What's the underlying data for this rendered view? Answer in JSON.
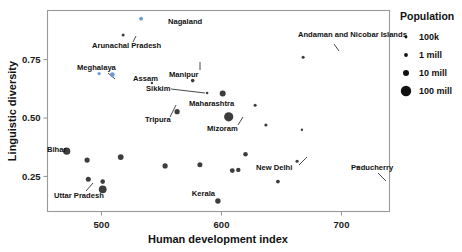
{
  "chart_data": {
    "type": "scatter",
    "title": "",
    "xlabel": "Human development index",
    "ylabel": "Linguistic diversity",
    "xlim": [
      455,
      740
    ],
    "ylim": [
      0.1,
      0.96
    ],
    "xticks": [
      500,
      600,
      700
    ],
    "xtick_labels": [
      "500",
      "600",
      "700"
    ],
    "yticks": [
      0.25,
      0.5,
      0.75
    ],
    "ytick_labels": [
      "0.25",
      "0.50",
      "0.75"
    ],
    "grid": false,
    "size_encoding": "Population",
    "points": [
      {
        "name": "Nagaland",
        "x": 533,
        "y": 0.925,
        "r": 1.9,
        "color": "#6d9bd1",
        "label": "Nagaland",
        "label_x": 168,
        "label_y": 24,
        "anchor": "start",
        "leader": false
      },
      {
        "name": "Arunachal Pradesh",
        "x": 518,
        "y": 0.855,
        "r": 1.5,
        "color": "#3d3d3d",
        "label": "Arunachal Pradesh",
        "label_x": 92,
        "label_y": 48,
        "anchor": "start",
        "leader": true,
        "lx1": 133,
        "ly1": 42,
        "lx2": 136,
        "ly2": 36
      },
      {
        "name": "Meghalaya",
        "x": 498,
        "y": 0.69,
        "r": 1.6,
        "color": "#6d9bd1",
        "label": "Meghalaya",
        "label_x": 77,
        "label_y": 70,
        "anchor": "start",
        "leader": true,
        "lx1": 108,
        "ly1": 73,
        "lx2": 115,
        "ly2": 79
      },
      {
        "name": "Assam",
        "x": 509,
        "y": 0.685,
        "r": 2.4,
        "color": "#6d9bd1",
        "label": "Assam",
        "label_x": 133,
        "label_y": 81,
        "anchor": "start",
        "leader": false
      },
      {
        "name": "Manipur",
        "x": 576,
        "y": 0.66,
        "r": 1.8,
        "color": "#3d3d3d",
        "label": "Manipur",
        "label_x": 169,
        "label_y": 77,
        "anchor": "start",
        "leader": true,
        "lx1": 200,
        "ly1": 70,
        "lx2": 200,
        "ly2": 62
      },
      {
        "name": "Sikkim",
        "x": 588,
        "y": 0.607,
        "r": 1.3,
        "color": "#3d3d3d",
        "label": "Sikkim",
        "label_x": 146,
        "label_y": 91,
        "anchor": "start",
        "leader": true,
        "lx1": 171,
        "ly1": 89,
        "lx2": 205,
        "ly2": 93
      },
      {
        "name": "Maharashtra",
        "x": 601,
        "y": 0.605,
        "r": 3.0,
        "color": "#3d3d3d",
        "label": "Maharashtra",
        "label_x": 189,
        "label_y": 106,
        "anchor": "start",
        "leader": false
      },
      {
        "name": "Tripura",
        "x": 563,
        "y": 0.527,
        "r": 2.6,
        "color": "#3d3d3d",
        "label": "Tripura",
        "label_x": 145,
        "label_y": 122,
        "anchor": "start",
        "leader": true,
        "lx1": 170,
        "ly1": 117,
        "lx2": 176,
        "ly2": 105
      },
      {
        "name": "Maharashtra-big",
        "x": 606,
        "y": 0.505,
        "r": 4.6,
        "color": "#3d3d3d",
        "label": "",
        "label_x": 0,
        "label_y": 0,
        "anchor": "start",
        "leader": false
      },
      {
        "name": "Mizoram",
        "x": 637,
        "y": 0.47,
        "r": 1.6,
        "color": "#3d3d3d",
        "label": "Mizoram",
        "label_x": 207,
        "label_y": 131,
        "anchor": "start",
        "leader": true,
        "lx1": 238,
        "ly1": 125,
        "lx2": 243,
        "ly2": 117
      },
      {
        "name": "Andaman and Nicobar Islands",
        "x": 668,
        "y": 0.76,
        "r": 1.5,
        "color": "#3d3d3d",
        "label": "Andaman and Nicobar Islands",
        "label_x": 298,
        "label_y": 37,
        "anchor": "start",
        "leader": true,
        "lx1": 334,
        "ly1": 44,
        "lx2": 339,
        "ly2": 51
      },
      {
        "name": "Bihar",
        "x": 471,
        "y": 0.358,
        "r": 3.6,
        "color": "#3d3d3d",
        "label": "Bihar",
        "label_x": 47,
        "label_y": 152,
        "anchor": "start",
        "leader": false
      },
      {
        "name": "Uttar Pradesh",
        "x": 501,
        "y": 0.195,
        "r": 3.9,
        "color": "#3d3d3d",
        "label": "Uttar Pradesh",
        "label_x": 54,
        "label_y": 198,
        "anchor": "start",
        "leader": true,
        "lx1": 86,
        "ly1": 191,
        "lx2": 93,
        "ly2": 183
      },
      {
        "name": "Kerala",
        "x": 597,
        "y": 0.145,
        "r": 2.7,
        "color": "#3d3d3d",
        "label": "Kerala",
        "label_x": 215,
        "label_y": 196,
        "anchor": "end",
        "leader": false
      },
      {
        "name": "New Delhi",
        "x": 663,
        "y": 0.315,
        "r": 1.6,
        "color": "#3d3d3d",
        "label": "New Delhi",
        "label_x": 256,
        "label_y": 170,
        "anchor": "start",
        "leader": true,
        "lx1": 299,
        "ly1": 165,
        "lx2": 307,
        "ly2": 157
      },
      {
        "name": "Puducherry",
        "x": 714,
        "y": 0.29,
        "r": 1.3,
        "color": "#3d3d3d",
        "label": "Puducherry",
        "label_x": 351,
        "label_y": 170,
        "anchor": "start",
        "leader": true,
        "lx1": 378,
        "ly1": 173,
        "lx2": 386,
        "ly2": 181
      },
      {
        "name": "p-18",
        "x": 488,
        "y": 0.32,
        "r": 2.6,
        "color": "#3d3d3d",
        "label": "",
        "label_x": 0,
        "label_y": 0,
        "anchor": "start",
        "leader": false
      },
      {
        "name": "p-19",
        "x": 489,
        "y": 0.238,
        "r": 2.5,
        "color": "#3d3d3d",
        "label": "",
        "label_x": 0,
        "label_y": 0,
        "anchor": "start",
        "leader": false
      },
      {
        "name": "p-20",
        "x": 501,
        "y": 0.228,
        "r": 2.3,
        "color": "#3d3d3d",
        "label": "",
        "label_x": 0,
        "label_y": 0,
        "anchor": "start",
        "leader": false
      },
      {
        "name": "p-21",
        "x": 516,
        "y": 0.333,
        "r": 2.9,
        "color": "#3d3d3d",
        "label": "",
        "label_x": 0,
        "label_y": 0,
        "anchor": "start",
        "leader": false
      },
      {
        "name": "p-22",
        "x": 553,
        "y": 0.295,
        "r": 2.6,
        "color": "#3d3d3d",
        "label": "",
        "label_x": 0,
        "label_y": 0,
        "anchor": "start",
        "leader": false
      },
      {
        "name": "p-23",
        "x": 582,
        "y": 0.3,
        "r": 2.5,
        "color": "#3d3d3d",
        "label": "",
        "label_x": 0,
        "label_y": 0,
        "anchor": "start",
        "leader": false
      },
      {
        "name": "p-24",
        "x": 609,
        "y": 0.275,
        "r": 2.4,
        "color": "#3d3d3d",
        "label": "",
        "label_x": 0,
        "label_y": 0,
        "anchor": "start",
        "leader": false
      },
      {
        "name": "p-25",
        "x": 614,
        "y": 0.278,
        "r": 2.2,
        "color": "#3d3d3d",
        "label": "",
        "label_x": 0,
        "label_y": 0,
        "anchor": "start",
        "leader": false
      },
      {
        "name": "p-26",
        "x": 620,
        "y": 0.345,
        "r": 2.3,
        "color": "#3d3d3d",
        "label": "",
        "label_x": 0,
        "label_y": 0,
        "anchor": "start",
        "leader": false
      },
      {
        "name": "p-27",
        "x": 647,
        "y": 0.228,
        "r": 1.9,
        "color": "#3d3d3d",
        "label": "",
        "label_x": 0,
        "label_y": 0,
        "anchor": "start",
        "leader": false
      },
      {
        "name": "p-28",
        "x": 628,
        "y": 0.555,
        "r": 1.5,
        "color": "#3d3d3d",
        "label": "",
        "label_x": 0,
        "label_y": 0,
        "anchor": "start",
        "leader": false
      },
      {
        "name": "p-29",
        "x": 667,
        "y": 0.45,
        "r": 1.2,
        "color": "#3d3d3d",
        "label": "",
        "label_x": 0,
        "label_y": 0,
        "anchor": "start",
        "leader": false
      },
      {
        "name": "p-30",
        "x": 542,
        "y": 0.65,
        "r": 1.2,
        "color": "#3d3d3d",
        "label": "",
        "label_x": 0,
        "label_y": 0,
        "anchor": "start",
        "leader": false
      }
    ]
  },
  "legend": {
    "title": "Population",
    "items": [
      {
        "label": "100k",
        "r": 1.4
      },
      {
        "label": "1 mill",
        "r": 1.9
      },
      {
        "label": "10 mill",
        "r": 3.0
      },
      {
        "label": "100 mill",
        "r": 5.2
      }
    ]
  },
  "colors": {
    "point": "#3d3d3d",
    "point_highlight": "#6d9bd1",
    "frame": "#9a9a9a",
    "text": "#111111",
    "background": "#ffffff"
  }
}
